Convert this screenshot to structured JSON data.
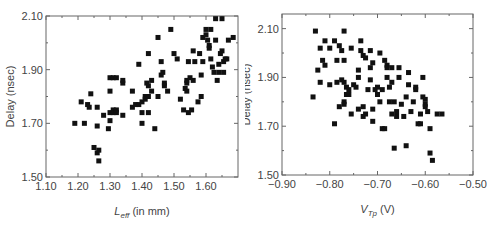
{
  "chart_data": [
    {
      "type": "scatter",
      "title": "",
      "xlabel": "L_eff (in mm)",
      "xlabel_main": "L",
      "xlabel_sub": "eff",
      "xlabel_rest": " (in mm)",
      "ylabel": "Delay (nsec)",
      "xlim": [
        1.1,
        1.7
      ],
      "ylim": [
        1.5,
        2.1
      ],
      "xticks": [
        1.1,
        1.2,
        1.3,
        1.4,
        1.5,
        1.6
      ],
      "xtick_labels": [
        "1.10",
        "1.20",
        "1.30",
        "1.40",
        "1.50",
        "1.60"
      ],
      "yticks": [
        1.5,
        1.7,
        1.9,
        2.1
      ],
      "ytick_labels": [
        "1.50",
        "1.70",
        "1.90",
        "2.10"
      ],
      "grid": false,
      "legend": null,
      "marker": "square",
      "points": [
        [
          1.19,
          1.7
        ],
        [
          1.21,
          1.78
        ],
        [
          1.22,
          1.7
        ],
        [
          1.23,
          1.77
        ],
        [
          1.235,
          1.76
        ],
        [
          1.24,
          1.81
        ],
        [
          1.25,
          1.61
        ],
        [
          1.26,
          1.59
        ],
        [
          1.265,
          1.6
        ],
        [
          1.265,
          1.56
        ],
        [
          1.26,
          1.76
        ],
        [
          1.26,
          1.69
        ],
        [
          1.28,
          1.73
        ],
        [
          1.295,
          1.68
        ],
        [
          1.3,
          1.82
        ],
        [
          1.3,
          1.74
        ],
        [
          1.3,
          1.71
        ],
        [
          1.3,
          1.87
        ],
        [
          1.31,
          1.87
        ],
        [
          1.31,
          1.75
        ],
        [
          1.31,
          1.74
        ],
        [
          1.32,
          1.87
        ],
        [
          1.32,
          1.75
        ],
        [
          1.32,
          1.74
        ],
        [
          1.34,
          1.85
        ],
        [
          1.34,
          1.86
        ],
        [
          1.34,
          1.73
        ],
        [
          1.37,
          1.82
        ],
        [
          1.37,
          1.76
        ],
        [
          1.38,
          1.77
        ],
        [
          1.39,
          1.92
        ],
        [
          1.39,
          1.77
        ],
        [
          1.4,
          1.78
        ],
        [
          1.4,
          1.74
        ],
        [
          1.4,
          1.7
        ],
        [
          1.41,
          1.8
        ],
        [
          1.41,
          1.79
        ],
        [
          1.415,
          1.85
        ],
        [
          1.42,
          1.96
        ],
        [
          1.42,
          1.84
        ],
        [
          1.42,
          1.8
        ],
        [
          1.42,
          1.74
        ],
        [
          1.43,
          1.86
        ],
        [
          1.43,
          1.82
        ],
        [
          1.44,
          1.68
        ],
        [
          1.45,
          1.8
        ],
        [
          1.45,
          2.02
        ],
        [
          1.46,
          1.93
        ],
        [
          1.46,
          1.88
        ],
        [
          1.465,
          1.89
        ],
        [
          1.47,
          1.84
        ],
        [
          1.47,
          1.85
        ],
        [
          1.48,
          1.82
        ],
        [
          1.49,
          2.05
        ],
        [
          1.5,
          1.96
        ],
        [
          1.51,
          1.94
        ],
        [
          1.52,
          1.79
        ],
        [
          1.53,
          1.75
        ],
        [
          1.535,
          1.83
        ],
        [
          1.54,
          1.85
        ],
        [
          1.54,
          1.86
        ],
        [
          1.54,
          1.82
        ],
        [
          1.545,
          1.74
        ],
        [
          1.545,
          1.93
        ],
        [
          1.55,
          1.87
        ],
        [
          1.555,
          1.75
        ],
        [
          1.56,
          1.86
        ],
        [
          1.56,
          1.97
        ],
        [
          1.565,
          1.93
        ],
        [
          1.575,
          1.78
        ],
        [
          1.58,
          1.96
        ],
        [
          1.585,
          1.8
        ],
        [
          1.585,
          1.88
        ],
        [
          1.59,
          2.02
        ],
        [
          1.59,
          1.93
        ],
        [
          1.6,
          2.05
        ],
        [
          1.6,
          2.03
        ],
        [
          1.605,
          2.01
        ],
        [
          1.61,
          1.99
        ],
        [
          1.61,
          1.98
        ],
        [
          1.615,
          2.05
        ],
        [
          1.615,
          1.94
        ],
        [
          1.62,
          1.91
        ],
        [
          1.625,
          1.89
        ],
        [
          1.63,
          2.09
        ],
        [
          1.63,
          2.01
        ],
        [
          1.635,
          1.86
        ],
        [
          1.64,
          1.89
        ],
        [
          1.64,
          1.92
        ],
        [
          1.645,
          1.96
        ],
        [
          1.65,
          1.97
        ],
        [
          1.65,
          2.09
        ],
        [
          1.655,
          1.89
        ],
        [
          1.655,
          1.93
        ],
        [
          1.66,
          1.94
        ],
        [
          1.665,
          1.94
        ],
        [
          1.67,
          2.01
        ],
        [
          1.685,
          2.02
        ]
      ]
    },
    {
      "type": "scatter",
      "title": "",
      "xlabel": "V_Tp (V)",
      "xlabel_main": "V",
      "xlabel_sub": "Tp",
      "xlabel_rest": " (V)",
      "ylabel": "Delay (nsec)",
      "xlim": [
        -0.9,
        -0.5
      ],
      "ylim": [
        1.5,
        2.16
      ],
      "xticks": [
        -0.9,
        -0.8,
        -0.7,
        -0.6,
        -0.5
      ],
      "xtick_labels": [
        "−0.90",
        "−0.80",
        "−0.70",
        "−0.60",
        "−0.50"
      ],
      "yticks": [
        1.5,
        1.7,
        1.9,
        2.1
      ],
      "ytick_labels": [
        "1.50",
        "1.70",
        "1.90",
        "2.10"
      ],
      "grid": false,
      "legend": null,
      "marker": "square",
      "points": [
        [
          -0.835,
          1.82
        ],
        [
          -0.83,
          2.09
        ],
        [
          -0.825,
          1.93
        ],
        [
          -0.82,
          2.02
        ],
        [
          -0.82,
          1.88
        ],
        [
          -0.815,
          1.97
        ],
        [
          -0.81,
          2.05
        ],
        [
          -0.81,
          1.95
        ],
        [
          -0.8,
          2.02
        ],
        [
          -0.8,
          1.87
        ],
        [
          -0.79,
          2.05
        ],
        [
          -0.79,
          1.71
        ],
        [
          -0.785,
          1.97
        ],
        [
          -0.785,
          1.88
        ],
        [
          -0.78,
          2.03
        ],
        [
          -0.78,
          1.78
        ],
        [
          -0.775,
          2.01
        ],
        [
          -0.775,
          1.89
        ],
        [
          -0.77,
          2.09
        ],
        [
          -0.77,
          1.97
        ],
        [
          -0.77,
          1.88
        ],
        [
          -0.77,
          1.8
        ],
        [
          -0.77,
          1.79
        ],
        [
          -0.765,
          1.83
        ],
        [
          -0.765,
          1.86
        ],
        [
          -0.76,
          1.85
        ],
        [
          -0.76,
          1.83
        ],
        [
          -0.755,
          2.02
        ],
        [
          -0.755,
          1.75
        ],
        [
          -0.75,
          1.87
        ],
        [
          -0.745,
          1.86
        ],
        [
          -0.74,
          1.93
        ],
        [
          -0.74,
          1.9
        ],
        [
          -0.74,
          1.77
        ],
        [
          -0.735,
          2.05
        ],
        [
          -0.735,
          2.01
        ],
        [
          -0.73,
          1.99
        ],
        [
          -0.73,
          1.78
        ],
        [
          -0.73,
          1.74
        ],
        [
          -0.725,
          1.98
        ],
        [
          -0.725,
          1.75
        ],
        [
          -0.72,
          1.85
        ],
        [
          -0.715,
          2.01
        ],
        [
          -0.715,
          1.89
        ],
        [
          -0.715,
          1.94
        ],
        [
          -0.71,
          1.96
        ],
        [
          -0.71,
          1.77
        ],
        [
          -0.71,
          1.72
        ],
        [
          -0.705,
          1.85
        ],
        [
          -0.7,
          1.86
        ],
        [
          -0.7,
          1.83
        ],
        [
          -0.695,
          1.8
        ],
        [
          -0.695,
          2.0
        ],
        [
          -0.69,
          1.85
        ],
        [
          -0.69,
          1.69
        ],
        [
          -0.685,
          1.97
        ],
        [
          -0.685,
          1.69
        ],
        [
          -0.68,
          1.95
        ],
        [
          -0.68,
          1.94
        ],
        [
          -0.68,
          1.9
        ],
        [
          -0.675,
          1.86
        ],
        [
          -0.675,
          1.8
        ],
        [
          -0.67,
          1.94
        ],
        [
          -0.67,
          1.88
        ],
        [
          -0.67,
          1.75
        ],
        [
          -0.665,
          1.61
        ],
        [
          -0.665,
          1.8
        ],
        [
          -0.66,
          1.74
        ],
        [
          -0.66,
          1.76
        ],
        [
          -0.655,
          1.9
        ],
        [
          -0.655,
          1.94
        ],
        [
          -0.65,
          1.79
        ],
        [
          -0.645,
          1.74
        ],
        [
          -0.64,
          1.82
        ],
        [
          -0.64,
          1.62
        ],
        [
          -0.635,
          1.87
        ],
        [
          -0.635,
          1.92
        ],
        [
          -0.63,
          1.76
        ],
        [
          -0.625,
          1.8
        ],
        [
          -0.62,
          1.86
        ],
        [
          -0.62,
          1.85
        ],
        [
          -0.615,
          1.71
        ],
        [
          -0.61,
          1.71
        ],
        [
          -0.61,
          1.75
        ],
        [
          -0.605,
          1.9
        ],
        [
          -0.605,
          1.82
        ],
        [
          -0.6,
          1.81
        ],
        [
          -0.6,
          1.79
        ],
        [
          -0.6,
          1.78
        ],
        [
          -0.595,
          1.76
        ],
        [
          -0.59,
          1.59
        ],
        [
          -0.59,
          1.69
        ],
        [
          -0.585,
          1.56
        ],
        [
          -0.575,
          1.75
        ],
        [
          -0.565,
          1.75
        ]
      ]
    }
  ]
}
